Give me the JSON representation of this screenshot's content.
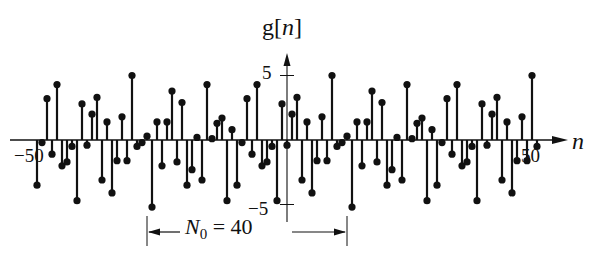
{
  "title": "g[n]",
  "chart_data": {
    "type": "stem",
    "title": "",
    "ylabel": "g[n]",
    "xlabel": "n",
    "xlim": [
      -50,
      50
    ],
    "ylim": [
      -5,
      5
    ],
    "x_ticks": [
      "-50",
      "50"
    ],
    "y_ticks": [
      "5",
      "-5"
    ],
    "grid": false,
    "period": 40,
    "annotation": "N0 = 40",
    "annotation_span": [
      -28,
      12
    ],
    "period_values": [
      -0.4,
      2.0,
      3.3,
      -3.1,
      1.4,
      -4.1,
      -1.6,
      1.8,
      -1.6,
      5.0,
      -0.5,
      -0.2,
      0.3,
      -5.2,
      1.4,
      -2.0,
      1.4,
      3.8,
      -1.7,
      2.9,
      -3.5,
      -2.3,
      0.2,
      -3.1,
      4.3,
      0.1,
      1.3,
      1.7,
      -4.7,
      0.8,
      -3.5,
      -0.2,
      3.2,
      -1.1,
      4.3,
      -2.0,
      -1.7,
      -0.5,
      -4.7,
      2.8
    ],
    "period_start_n": -40
  },
  "labels": {
    "ylabel_prefix": "g[",
    "ylabel_var": "n",
    "ylabel_suffix": "]",
    "xlabel": "n",
    "tick_pos5": "5",
    "tick_neg5": "−5",
    "tick_neg50": "−50",
    "tick_pos50": "50",
    "annot_var": "N",
    "annot_sub": "0",
    "annot_rest": " = 40"
  },
  "colors": {
    "ink": "#111111",
    "background": "#ffffff"
  }
}
